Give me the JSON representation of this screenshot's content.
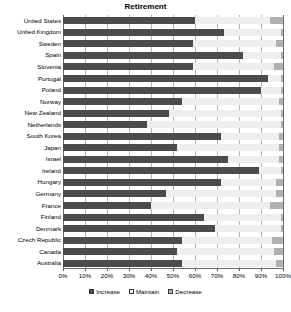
{
  "chart_data": {
    "type": "bar",
    "subtype": "horizontal-stacked-100-percent",
    "title": "Retirement",
    "xlabel": "",
    "ylabel": "",
    "xlim": [
      0,
      100
    ],
    "xticks": [
      "0%",
      "10%",
      "20%",
      "30%",
      "40%",
      "50%",
      "60%",
      "70%",
      "80%",
      "90%",
      "100%"
    ],
    "grid": true,
    "legend_position": "bottom-center",
    "categories": [
      "United States",
      "United Kingdom",
      "Sweden",
      "Spain",
      "Slovenia",
      "Portugal",
      "Poland",
      "Norway",
      "New Zealand",
      "Netherlands",
      "South Korea",
      "Japan",
      "Israel",
      "Ireland",
      "Hungary",
      "Germany",
      "France",
      "Finland",
      "Denmark",
      "Czech Republic",
      "Canada",
      "Australia"
    ],
    "series": [
      {
        "name": "Increase",
        "color": "#4b4b4b",
        "values": [
          60,
          73,
          59,
          82,
          59,
          93,
          90,
          54,
          48,
          38,
          72,
          52,
          75,
          89,
          72,
          47,
          40,
          64,
          69,
          54,
          52,
          54
        ]
      },
      {
        "name": "Maintain",
        "color": "#eeeeee",
        "values": [
          34,
          26,
          38,
          17,
          37,
          6,
          9,
          44,
          51,
          61,
          26,
          46,
          23,
          10,
          25,
          50,
          54,
          35,
          30,
          41,
          44,
          43
        ]
      },
      {
        "name": "Decrease",
        "color": "#b0b0b0",
        "values": [
          6,
          1,
          3,
          1,
          4,
          1,
          1,
          2,
          1,
          1,
          2,
          2,
          2,
          1,
          3,
          3,
          6,
          1,
          1,
          5,
          4,
          3
        ]
      }
    ]
  },
  "legend": {
    "items": [
      {
        "label": "Increase"
      },
      {
        "label": "Maintain"
      },
      {
        "label": "Decrease"
      }
    ]
  }
}
